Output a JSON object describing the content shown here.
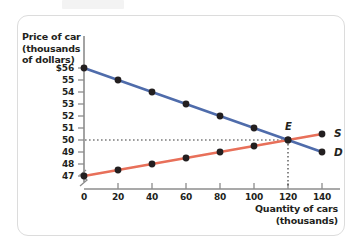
{
  "figure": {
    "y_axis_title_lines": [
      "Price of car",
      "(thousands",
      "of dollars)"
    ],
    "x_axis_title_lines": [
      "Quantity of cars",
      "(thousands)"
    ],
    "supply_label": "S",
    "demand_label": "D",
    "equilibrium_label": "E",
    "supply_color": "#e8705a",
    "demand_color": "#4f6cab",
    "point_color": "#231f20",
    "axis_color": "#8c8c8c",
    "frame_color": "#dcdcdc",
    "text_color": "#231f20"
  },
  "chart_data": {
    "type": "line",
    "title": "",
    "xlabel": "Quantity of cars (thousands)",
    "ylabel": "Price of car (thousands of dollars)",
    "xlim": [
      0,
      150
    ],
    "ylim": [
      46.5,
      56.5
    ],
    "xticks": [
      0,
      20,
      40,
      60,
      80,
      100,
      120,
      140
    ],
    "xtick_labels": [
      "0",
      "20",
      "40",
      "60",
      "80",
      "100",
      "120",
      "140"
    ],
    "yticks": [
      47,
      48,
      49,
      50,
      51,
      52,
      53,
      54,
      55,
      56
    ],
    "ytick_labels": [
      "47",
      "48",
      "49",
      "50",
      "51",
      "52",
      "53",
      "54",
      "55",
      "$56"
    ],
    "grid": false,
    "y_axis_break": true,
    "x_axis_break": true,
    "legend_position": "inline-curve-ends",
    "series": [
      {
        "name": "D",
        "label": "Demand",
        "color": "#4f6cab",
        "x": [
          0,
          20,
          40,
          60,
          80,
          100,
          120,
          140
        ],
        "values": [
          56,
          55,
          54,
          53,
          52,
          51,
          50,
          49
        ]
      },
      {
        "name": "S",
        "label": "Supply",
        "color": "#e8705a",
        "x": [
          0,
          20,
          40,
          60,
          80,
          100,
          120,
          140
        ],
        "values": [
          47,
          47.5,
          48,
          48.5,
          49,
          49.5,
          50,
          50.5
        ]
      }
    ],
    "annotations": [
      {
        "label": "E",
        "type": "equilibrium-point",
        "x": 120,
        "y": 50,
        "guide_lines": [
          "horizontal-dotted-to-y-axis",
          "vertical-dotted-to-x-axis"
        ]
      }
    ]
  }
}
